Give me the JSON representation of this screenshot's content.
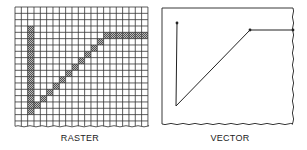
{
  "raster": {
    "label": "RASTER",
    "grid": {
      "cols": 21,
      "rows": 19,
      "cell": 6.33,
      "x": 15,
      "y": 7
    },
    "pixels": [
      [
        2,
        3
      ],
      [
        2,
        4
      ],
      [
        2,
        5
      ],
      [
        2,
        6
      ],
      [
        2,
        7
      ],
      [
        2,
        8
      ],
      [
        2,
        9
      ],
      [
        2,
        10
      ],
      [
        2,
        11
      ],
      [
        2,
        12
      ],
      [
        2,
        13
      ],
      [
        2,
        14
      ],
      [
        2,
        15
      ],
      [
        2,
        16
      ],
      [
        3,
        15
      ],
      [
        4,
        14
      ],
      [
        5,
        13
      ],
      [
        6,
        12
      ],
      [
        7,
        11
      ],
      [
        8,
        10
      ],
      [
        9,
        9
      ],
      [
        10,
        8
      ],
      [
        11,
        7
      ],
      [
        12,
        6
      ],
      [
        13,
        5
      ],
      [
        14,
        4
      ],
      [
        15,
        4
      ],
      [
        16,
        4
      ],
      [
        17,
        4
      ],
      [
        18,
        4
      ],
      [
        19,
        4
      ],
      [
        20,
        4
      ]
    ]
  },
  "vector": {
    "label": "VECTOR",
    "box": {
      "x": 162,
      "y": 8,
      "w": 131,
      "h": 116
    },
    "points": [
      [
        177,
        23
      ],
      [
        176,
        106
      ],
      [
        250,
        30
      ],
      [
        293,
        30
      ]
    ]
  },
  "colors": {
    "line": "#222222",
    "pixel": "#8a8a8a",
    "grid": "#333333"
  }
}
